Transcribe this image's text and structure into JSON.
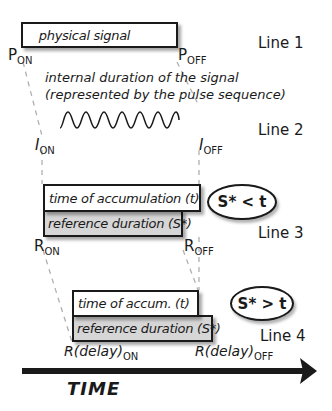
{
  "line1": {
    "label": "Line 1",
    "box_text": "physical signal",
    "on_label": {
      "main": "P",
      "sub": "ON"
    },
    "off_label": {
      "main": "P",
      "sub": "OFF"
    }
  },
  "line2": {
    "label": "Line 2",
    "caption_1": "internal duration of the signal",
    "caption_2": "(represented by the pulse sequence)",
    "on_label": {
      "main": "I",
      "sub": "ON"
    },
    "off_label": {
      "main": "I",
      "sub": "OFF"
    }
  },
  "line3": {
    "label": "Line 3",
    "top_box_text": "time of accumulation (t)",
    "bottom_box_text": "reference duration (S*)",
    "comparison": "S* < t",
    "on_label": {
      "main": "R",
      "sub": "ON"
    },
    "off_label": {
      "main": "R",
      "sub": "OFF"
    }
  },
  "line4": {
    "label": "Line 4",
    "top_box_text": "time of accum. (t)",
    "bottom_box_text": "reference duration (S*)",
    "comparison": "S* > t",
    "on_label": {
      "main": "R(delay)",
      "sub": "ON"
    },
    "off_label": {
      "main": "R(delay)",
      "sub": "OFF"
    }
  },
  "axis": {
    "label": "TIME"
  },
  "colors": {
    "stroke": "#1a1a1a",
    "gray_fill": "#d6d6d6",
    "dashed": "#b0b0b0"
  }
}
